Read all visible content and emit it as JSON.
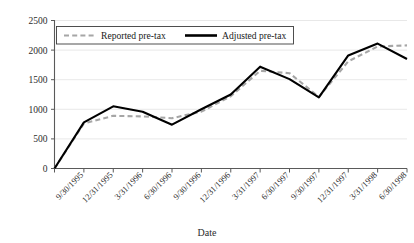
{
  "chart_data": {
    "type": "line",
    "title": "",
    "xlabel": "Date",
    "ylabel": "",
    "ylim": [
      0,
      2500
    ],
    "yticks": [
      0,
      500,
      1000,
      1500,
      2000,
      2500
    ],
    "grid": true,
    "legend_position": "top-center",
    "categories": [
      "",
      "9/30/1995",
      "12/31/1995",
      "3/31/1996",
      "6/30/1996",
      "9/30/1996",
      "12/31/1996",
      "3/31/1997",
      "6/30/1997",
      "9/30/1997",
      "12/31/1997",
      "3/31/1998",
      "6/30/1998"
    ],
    "series": [
      {
        "name": "Reported pre-tax",
        "style": "dashed",
        "color": "#a6a6a6",
        "values": [
          0,
          760,
          890,
          880,
          850,
          960,
          1220,
          1650,
          1610,
          1210,
          1810,
          2060,
          2080
        ]
      },
      {
        "name": "Adjusted pre-tax",
        "style": "solid",
        "color": "#000000",
        "values": [
          0,
          780,
          1050,
          960,
          740,
          1000,
          1250,
          1720,
          1510,
          1200,
          1910,
          2110,
          1850
        ]
      }
    ]
  },
  "axes": {
    "x_title": "Date",
    "y_tick_labels": [
      "0",
      "500",
      "1000",
      "1500",
      "2000",
      "2500"
    ],
    "x_tick_labels": [
      "9/30/1995",
      "12/31/1995",
      "3/31/1996",
      "6/30/1996",
      "9/30/1996",
      "12/31/1996",
      "3/31/1997",
      "6/30/1997",
      "9/30/1997",
      "12/31/1997",
      "3/31/1998",
      "6/30/1998"
    ]
  },
  "legend": {
    "entries": [
      {
        "label": "Reported pre-tax"
      },
      {
        "label": "Adjusted pre-tax"
      }
    ]
  },
  "colors": {
    "reported_series": "#a6a6a6",
    "adjusted_series": "#000000",
    "gridline": "#e2e2e2",
    "axis": "#5a5a5a"
  }
}
